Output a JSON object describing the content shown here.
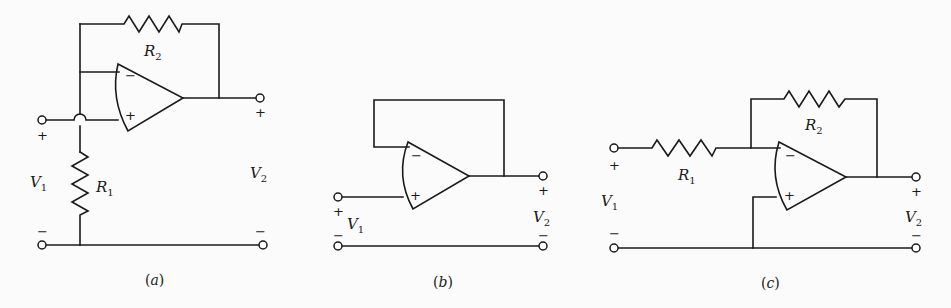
{
  "figure": {
    "circuits": [
      {
        "id": "a",
        "caption_open": "(",
        "caption_letter": "a",
        "caption_close": ")",
        "type": "non-inverting amplifier",
        "components": {
          "feedback_resistor": {
            "name": "R",
            "sub": "2"
          },
          "ground_resistor": {
            "name": "R",
            "sub": "1"
          }
        },
        "input": {
          "name": "V",
          "sub": "1",
          "plus": "+",
          "minus": "−"
        },
        "output": {
          "name": "V",
          "sub": "2",
          "plus": "+",
          "minus": "−"
        },
        "opamp": {
          "inverting": "−",
          "noninverting": "+"
        }
      },
      {
        "id": "b",
        "caption_open": "(",
        "caption_letter": "b",
        "caption_close": ")",
        "type": "voltage follower",
        "input": {
          "name": "V",
          "sub": "1",
          "plus": "+",
          "minus": "−"
        },
        "output": {
          "name": "V",
          "sub": "2",
          "plus": "+",
          "minus": "−"
        },
        "opamp": {
          "inverting": "−",
          "noninverting": "+"
        }
      },
      {
        "id": "c",
        "caption_open": "(",
        "caption_letter": "c",
        "caption_close": ")",
        "type": "inverting amplifier",
        "components": {
          "input_resistor": {
            "name": "R",
            "sub": "1"
          },
          "feedback_resistor": {
            "name": "R",
            "sub": "2"
          }
        },
        "input": {
          "name": "V",
          "sub": "1",
          "plus": "+",
          "minus": "−"
        },
        "output": {
          "name": "V",
          "sub": "2",
          "plus": "+",
          "minus": "−"
        },
        "opamp": {
          "inverting": "−",
          "noninverting": "+"
        }
      }
    ]
  }
}
